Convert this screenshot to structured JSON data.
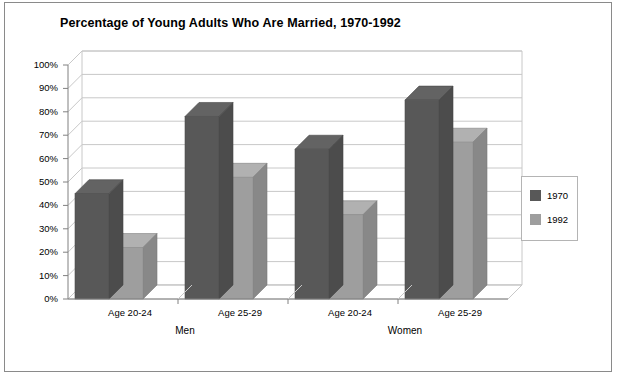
{
  "chart_data": {
    "type": "bar",
    "title": "Percentage of Young Adults Who Are Married, 1970-1992",
    "xlabel": "",
    "ylabel": "",
    "ylim": [
      0,
      100
    ],
    "ytick_labels": [
      "0%",
      "10%",
      "20%",
      "30%",
      "40%",
      "50%",
      "60%",
      "70%",
      "80%",
      "90%",
      "100%"
    ],
    "ytick_values": [
      0,
      10,
      20,
      30,
      40,
      50,
      60,
      70,
      80,
      90,
      100
    ],
    "categories": [
      "Age 20-24",
      "Age 25-29",
      "Age 20-24",
      "Age 25-29"
    ],
    "groups": [
      {
        "label": "Men",
        "categories": [
          "Age 20-24",
          "Age 25-29"
        ]
      },
      {
        "label": "Women",
        "categories": [
          "Age 20-24",
          "Age 25-29"
        ]
      }
    ],
    "series": [
      {
        "name": "1970",
        "color": "#585858",
        "values": [
          45,
          78,
          64,
          85
        ]
      },
      {
        "name": "1992",
        "color": "#9e9e9e",
        "values": [
          22,
          52,
          36,
          67
        ]
      }
    ],
    "legend": {
      "position": "right",
      "entries": [
        "1970",
        "1992"
      ]
    },
    "grid": true,
    "style": "3d-clustered-column",
    "units": "percent"
  },
  "legend": {
    "items": [
      {
        "label": "1970",
        "color": "#585858"
      },
      {
        "label": "1992",
        "color": "#9e9e9e"
      }
    ]
  },
  "colors": {
    "series_1970": "#585858",
    "series_1992": "#9e9e9e",
    "grid": "#c8c8c8",
    "axis": "#808080",
    "frame": "#8a8a8a",
    "text": "#000000"
  }
}
